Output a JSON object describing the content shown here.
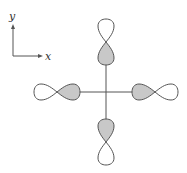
{
  "diagram": {
    "axes_indicator": {
      "x_label": "x",
      "y_label": "y"
    },
    "orbitals": [
      {
        "position": "top",
        "orientation": "vertical",
        "shaded_lobe": "inner"
      },
      {
        "position": "bottom",
        "orientation": "vertical",
        "shaded_lobe": "inner"
      },
      {
        "position": "left",
        "orientation": "horizontal",
        "shaded_lobe": "inner"
      },
      {
        "position": "right",
        "orientation": "horizontal",
        "shaded_lobe": "inner"
      }
    ],
    "colors": {
      "line": "#555555",
      "shaded_lobe": "#c8c8c8",
      "open_lobe": "#ffffff"
    }
  }
}
